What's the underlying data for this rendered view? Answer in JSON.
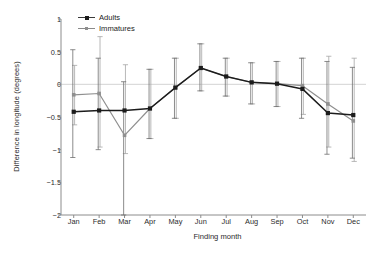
{
  "chart_data": {
    "type": "line",
    "title": "",
    "xlabel": "Finding month",
    "ylabel": "Difference in longitude (degrees)",
    "categories": [
      "Jan",
      "Feb",
      "Mar",
      "Apr",
      "May",
      "Jun",
      "Jul",
      "Aug",
      "Sep",
      "Oct",
      "Nov",
      "Dec"
    ],
    "ylim": [
      -2,
      1
    ],
    "yticks": [
      1,
      0.5,
      0,
      -0.5,
      -1,
      -1.5,
      -2
    ],
    "ytick_labels": [
      "1",
      "0.5",
      "0",
      "-0.5",
      "-1",
      "-1.5",
      "-2"
    ],
    "grid": false,
    "zero_line": true,
    "legend_position": "top-left",
    "series": [
      {
        "name": "Adults",
        "color": "#1c1c1c",
        "marker": "filled-square",
        "values": [
          -0.42,
          -0.4,
          -0.4,
          -0.37,
          -0.05,
          0.25,
          0.12,
          0.03,
          0.01,
          -0.07,
          -0.44,
          -0.47
        ],
        "err_low": [
          -1.12,
          -1.0,
          -2.0,
          -0.83,
          -0.52,
          -0.1,
          -0.18,
          -0.3,
          -0.34,
          -0.52,
          -1.07,
          -1.13
        ],
        "err_high": [
          0.53,
          0.4,
          0.04,
          0.23,
          0.4,
          0.62,
          0.4,
          0.33,
          0.35,
          0.4,
          0.35,
          0.26
        ]
      },
      {
        "name": "Immatures",
        "color": "#8f8f8f",
        "marker": "filled-square",
        "values": [
          -0.16,
          -0.14,
          -0.78,
          -0.37,
          -0.05,
          0.25,
          0.12,
          0.03,
          0.01,
          -0.02,
          -0.3,
          -0.56
        ],
        "err_low": [
          -0.62,
          -0.96,
          -1.06,
          -0.83,
          -0.52,
          -0.1,
          -0.18,
          -0.3,
          -0.34,
          -0.46,
          -0.96,
          -1.18
        ],
        "err_high": [
          0.29,
          0.73,
          0.3,
          0.23,
          0.4,
          0.62,
          0.4,
          0.33,
          0.35,
          0.4,
          0.43,
          0.4
        ]
      }
    ]
  },
  "legend": {
    "items": [
      {
        "label": "Adults"
      },
      {
        "label": "Immatures"
      }
    ]
  }
}
